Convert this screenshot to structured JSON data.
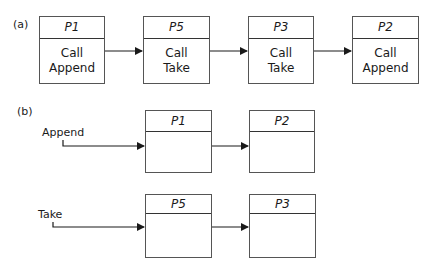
{
  "part_a": {
    "label": "(a)",
    "boxes": [
      {
        "title": "P1",
        "line1": "Call",
        "line2": "Append"
      },
      {
        "title": "P5",
        "line1": "Call",
        "line2": "Take"
      },
      {
        "title": "P3",
        "line1": "Call",
        "line2": "Take"
      },
      {
        "title": "P2",
        "line1": "Call",
        "line2": "Append"
      }
    ]
  },
  "part_b": {
    "label": "(b)",
    "queues": [
      {
        "name": "Append",
        "boxes": [
          {
            "title": "P1"
          },
          {
            "title": "P2"
          }
        ]
      },
      {
        "name": "Take",
        "boxes": [
          {
            "title": "P5"
          },
          {
            "title": "P3"
          }
        ]
      }
    ]
  }
}
